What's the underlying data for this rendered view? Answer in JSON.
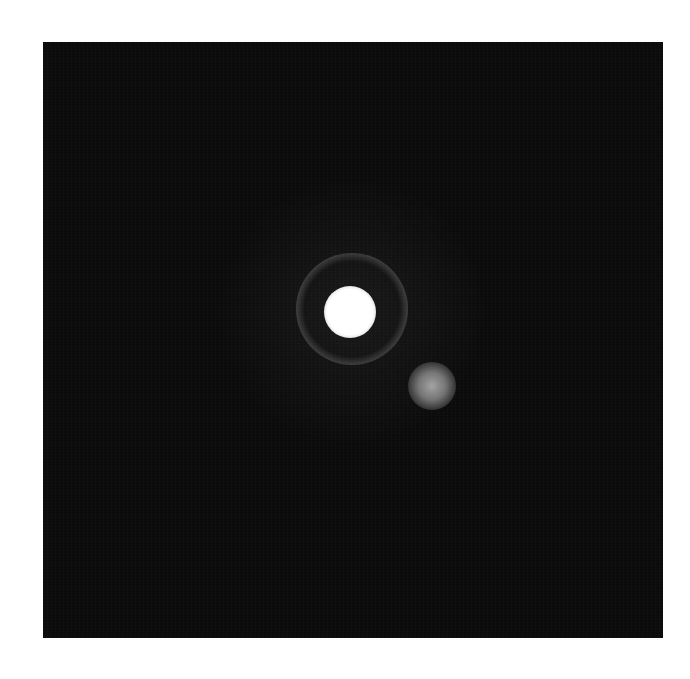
{
  "image": {
    "description": "Astronomical image of a bright star with a diffraction ring and a fainter companion to the lower right, on a dark background",
    "background_color": "#0b0b0b",
    "page_color": "#ffffff",
    "panel": {
      "x": 43,
      "y": 42,
      "width": 620,
      "height": 596
    },
    "objects": [
      {
        "name": "halo",
        "cx": 352,
        "cy": 312,
        "radius": 130,
        "color": "#ffffff"
      },
      {
        "name": "diffraction-ring",
        "cx": 352,
        "cy": 309,
        "radius": 56,
        "color": "#ffffff"
      },
      {
        "name": "primary-star",
        "cx": 350,
        "cy": 312,
        "radius": 26,
        "color": "#ffffff"
      },
      {
        "name": "companion-star",
        "cx": 432,
        "cy": 386,
        "radius": 24,
        "color": "#c8c8c8"
      }
    ]
  }
}
